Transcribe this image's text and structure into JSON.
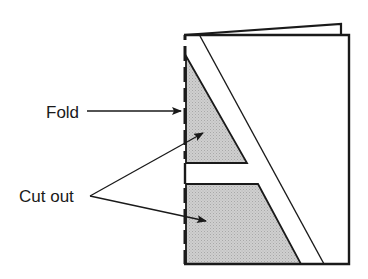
{
  "diagram": {
    "labels": {
      "fold": "Fold",
      "cut_out": "Cut out"
    },
    "colors": {
      "stroke": "#1a1a1a",
      "shade": "#c8c8c8",
      "paper": "#ffffff"
    },
    "parts": [
      {
        "id": "folded-card",
        "description": "Folded card with back page visible above"
      },
      {
        "id": "fold-line",
        "style": "dashed",
        "side": "left"
      },
      {
        "id": "letter-A-outline",
        "description": "Diagonal stroke forming letter A"
      },
      {
        "id": "cutout-upper",
        "shape": "triangle",
        "fill": "shaded"
      },
      {
        "id": "cutout-lower",
        "shape": "trapezoid",
        "fill": "shaded"
      }
    ],
    "arrows": [
      {
        "from": "Fold",
        "to": "fold-line"
      },
      {
        "from": "Cut out",
        "to": "cutout-upper"
      },
      {
        "from": "Cut out",
        "to": "cutout-lower"
      }
    ]
  }
}
